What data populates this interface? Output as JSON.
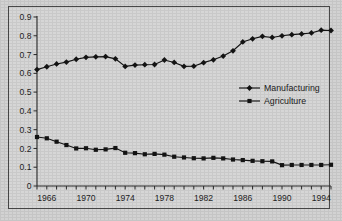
{
  "chart_data": {
    "type": "line",
    "title": "",
    "xlabel": "",
    "ylabel": "",
    "xlim": [
      1965,
      1995
    ],
    "ylim": [
      0,
      0.9
    ],
    "grid": false,
    "legend_position": "center-right inside plot area",
    "y_ticks": [
      "0",
      "0.1",
      "0.2",
      "0.3",
      "0.4",
      "0.5",
      "0.6",
      "0.7",
      "0.8",
      "0.9"
    ],
    "y_tick_values": [
      0,
      0.1,
      0.2,
      0.3,
      0.4,
      0.5,
      0.6,
      0.7,
      0.8,
      0.9
    ],
    "x_tick_labels": [
      "1966",
      "1970",
      "1974",
      "1978",
      "1982",
      "1986",
      "1990",
      "1994"
    ],
    "x_tick_label_values": [
      1966,
      1970,
      1974,
      1978,
      1982,
      1986,
      1990,
      1994
    ],
    "x": [
      1965,
      1966,
      1967,
      1968,
      1969,
      1970,
      1971,
      1972,
      1973,
      1974,
      1975,
      1976,
      1977,
      1978,
      1979,
      1980,
      1981,
      1982,
      1983,
      1984,
      1985,
      1986,
      1987,
      1988,
      1989,
      1990,
      1991,
      1992,
      1993,
      1994,
      1995
    ],
    "series": [
      {
        "name": "Manufacturing",
        "marker": "diamond",
        "color": "#141414",
        "values": [
          0.62,
          0.635,
          0.65,
          0.66,
          0.675,
          0.685,
          0.688,
          0.689,
          0.677,
          0.637,
          0.644,
          0.646,
          0.647,
          0.671,
          0.658,
          0.637,
          0.638,
          0.657,
          0.672,
          0.692,
          0.72,
          0.767,
          0.784,
          0.797,
          0.791,
          0.8,
          0.806,
          0.81,
          0.815,
          0.83,
          0.828
        ]
      },
      {
        "name": "Agriculture",
        "marker": "square",
        "color": "#141414",
        "values": [
          0.261,
          0.254,
          0.236,
          0.218,
          0.2,
          0.201,
          0.193,
          0.195,
          0.202,
          0.177,
          0.175,
          0.169,
          0.171,
          0.167,
          0.156,
          0.152,
          0.148,
          0.147,
          0.15,
          0.147,
          0.141,
          0.138,
          0.134,
          0.132,
          0.131,
          0.111,
          0.112,
          0.112,
          0.112,
          0.112,
          0.113
        ]
      }
    ]
  },
  "legend": {
    "items": [
      {
        "label": "Manufacturing"
      },
      {
        "label": "Agriculture"
      }
    ]
  }
}
